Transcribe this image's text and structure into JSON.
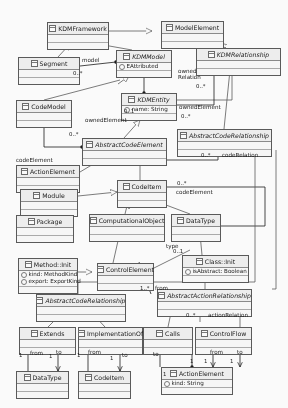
{
  "diagram": {
    "notation": "UML class diagram",
    "classes": [
      {
        "id": "kdmframework",
        "name": "KDMFramework",
        "abstract": false,
        "attributes": [],
        "x": 47,
        "y": 22,
        "w": 62,
        "h": 20
      },
      {
        "id": "modelelement",
        "name": "ModelElement",
        "abstract": false,
        "attributes": [],
        "x": 161,
        "y": 21,
        "w": 63,
        "h": 20
      },
      {
        "id": "segment",
        "name": "Segment",
        "abstract": false,
        "attributes": [],
        "x": 18,
        "y": 57,
        "w": 62,
        "h": 22
      },
      {
        "id": "kdmmodel",
        "name": "KDMModel",
        "abstract": true,
        "attributes": [
          "EAttributed"
        ],
        "x": 116,
        "y": 50,
        "w": 56,
        "h": 26
      },
      {
        "id": "kdmrelationship",
        "name": "KDMRelationship",
        "abstract": true,
        "attributes": [],
        "x": 196,
        "y": 48,
        "w": 85,
        "h": 20
      },
      {
        "id": "kdmentity",
        "name": "KDMEntity",
        "abstract": true,
        "attributes": [
          "name: String"
        ],
        "x": 121,
        "y": 93,
        "w": 56,
        "h": 25
      },
      {
        "id": "codemodel",
        "name": "CodeModel",
        "abstract": false,
        "attributes": [],
        "x": 16,
        "y": 100,
        "w": 56,
        "h": 22
      },
      {
        "id": "abstractcodeelement",
        "name": "AbstractCodeElement",
        "abstract": true,
        "attributes": [],
        "x": 82,
        "y": 138,
        "w": 85,
        "h": 19
      },
      {
        "id": "abstractcoderelationship1",
        "name": "AbstractCodeRelationship",
        "abstract": true,
        "attributes": [],
        "x": 177,
        "y": 129,
        "w": 95,
        "h": 19
      },
      {
        "id": "actionelement1",
        "name": "ActionElement",
        "abstract": false,
        "attributes": [],
        "x": 16,
        "y": 165,
        "w": 64,
        "h": 18
      },
      {
        "id": "module",
        "name": "Module",
        "abstract": false,
        "attributes": [],
        "x": 20,
        "y": 189,
        "w": 58,
        "h": 20
      },
      {
        "id": "package",
        "name": "Package",
        "abstract": false,
        "attributes": [],
        "x": 16,
        "y": 215,
        "w": 58,
        "h": 18
      },
      {
        "id": "codeitem1",
        "name": "CodeItem",
        "abstract": false,
        "attributes": [],
        "x": 117,
        "y": 180,
        "w": 50,
        "h": 20
      },
      {
        "id": "computationalobject",
        "name": "ComputationalObject",
        "abstract": false,
        "attributes": [],
        "x": 89,
        "y": 214,
        "w": 76,
        "h": 18
      },
      {
        "id": "datatype1",
        "name": "DataType",
        "abstract": false,
        "attributes": [],
        "x": 171,
        "y": 214,
        "w": 50,
        "h": 18
      },
      {
        "id": "methodinit",
        "name": "Method::Init",
        "abstract": false,
        "attributes": [
          "kind: MethodKind",
          "export: ExportKind"
        ],
        "x": 18,
        "y": 258,
        "w": 60,
        "h": 28
      },
      {
        "id": "controlelement",
        "name": "ControlElement",
        "abstract": false,
        "attributes": [],
        "x": 97,
        "y": 263,
        "w": 57,
        "h": 20
      },
      {
        "id": "classinit",
        "name": "Class::Init",
        "abstract": false,
        "attributes": [
          "isAbstract: Boolean"
        ],
        "x": 182,
        "y": 255,
        "w": 67,
        "h": 25
      },
      {
        "id": "abstractcoderelationship2",
        "name": "AbstractCodeRelationship",
        "abstract": true,
        "attributes": [],
        "x": 36,
        "y": 294,
        "w": 90,
        "h": 17
      },
      {
        "id": "abstractactionrelationship",
        "name": "AbstractActionRelationship",
        "abstract": true,
        "attributes": [],
        "x": 157,
        "y": 289,
        "w": 95,
        "h": 17
      },
      {
        "id": "extends",
        "name": "Extends",
        "abstract": false,
        "attributes": [],
        "x": 19,
        "y": 327,
        "w": 57,
        "h": 18
      },
      {
        "id": "implementationof",
        "name": "ImplementationOf",
        "abstract": false,
        "attributes": [],
        "x": 78,
        "y": 327,
        "w": 65,
        "h": 18
      },
      {
        "id": "calls",
        "name": "Calls",
        "abstract": false,
        "attributes": [],
        "x": 143,
        "y": 327,
        "w": 50,
        "h": 18
      },
      {
        "id": "controlflow",
        "name": "ControlFlow",
        "abstract": false,
        "attributes": [],
        "x": 195,
        "y": 327,
        "w": 57,
        "h": 18
      },
      {
        "id": "datatype2",
        "name": "DataType",
        "abstract": false,
        "attributes": [],
        "x": 16,
        "y": 371,
        "w": 53,
        "h": 18
      },
      {
        "id": "codeitem2",
        "name": "CodeItem",
        "abstract": false,
        "attributes": [],
        "x": 78,
        "y": 371,
        "w": 53,
        "h": 18
      },
      {
        "id": "actionelement2",
        "name": "ActionElement",
        "abstract": false,
        "attributes": [
          "kind: String"
        ],
        "x": 161,
        "y": 367,
        "w": 72,
        "h": 25
      }
    ],
    "association_labels": [
      {
        "id": "model",
        "text": "model",
        "x": 82,
        "y": 57
      },
      {
        "id": "ownedrelation",
        "text": "owned Relation",
        "x": 178,
        "y": 68,
        "wrap": true
      },
      {
        "id": "ownedelement-a",
        "text": "ownedElement",
        "x": 85,
        "y": 117
      },
      {
        "id": "ownedelement-b",
        "text": "ownedElement",
        "x": 179,
        "y": 104
      },
      {
        "id": "codeelement-left",
        "text": "codeElement",
        "x": 16,
        "y": 157
      },
      {
        "id": "coderelation",
        "text": "codeRelation",
        "x": 222,
        "y": 152
      },
      {
        "id": "codeelement-mid",
        "text": "codeElement",
        "x": 176,
        "y": 189
      },
      {
        "id": "type",
        "text": "type",
        "x": 166,
        "y": 243
      },
      {
        "id": "from-upper",
        "text": "from",
        "x": 155,
        "y": 285
      },
      {
        "id": "actionrelation",
        "text": "actionRelation",
        "x": 208,
        "y": 312
      },
      {
        "id": "from-extends",
        "text": "from",
        "x": 30,
        "y": 350
      },
      {
        "id": "to-extends",
        "text": "to",
        "x": 56,
        "y": 349
      },
      {
        "id": "from-implof",
        "text": "from",
        "x": 88,
        "y": 349
      },
      {
        "id": "to-implof",
        "text": "to",
        "x": 122,
        "y": 352
      },
      {
        "id": "to-calls",
        "text": "to",
        "x": 153,
        "y": 351
      },
      {
        "id": "from-cflow",
        "text": "from",
        "x": 210,
        "y": 349
      },
      {
        "id": "to-cflow",
        "text": "to",
        "x": 237,
        "y": 349
      }
    ],
    "multiplicities": [
      {
        "id": "m-segment-model",
        "text": "0..*",
        "x": 73,
        "y": 70
      },
      {
        "id": "m-kdmmodel-owned",
        "text": "0..1",
        "x": 124,
        "y": 108
      },
      {
        "id": "m-ownedrelation",
        "text": "0..*",
        "x": 196,
        "y": 83
      },
      {
        "id": "m-kdmentity-owned",
        "text": "0..*",
        "x": 181,
        "y": 113
      },
      {
        "id": "m-codemodel-elem",
        "text": "0..*",
        "x": 69,
        "y": 131
      },
      {
        "id": "m-coderelation",
        "text": "0..*",
        "x": 201,
        "y": 152
      },
      {
        "id": "m-codeitem-elem",
        "text": "0..*",
        "x": 177,
        "y": 180
      },
      {
        "id": "m-type",
        "text": "0..1",
        "x": 173,
        "y": 248
      },
      {
        "id": "m-from-upper",
        "text": "1..*",
        "x": 140,
        "y": 285
      },
      {
        "id": "m-actionrelation",
        "text": "0..*",
        "x": 186,
        "y": 312
      },
      {
        "id": "m-extends-1a",
        "text": "1",
        "x": 19,
        "y": 352
      },
      {
        "id": "m-extends-1b",
        "text": "1",
        "x": 49,
        "y": 353
      },
      {
        "id": "m-implof-1a",
        "text": "1",
        "x": 77,
        "y": 352
      },
      {
        "id": "m-implof-1b",
        "text": "1",
        "x": 110,
        "y": 355
      },
      {
        "id": "m-actionelement-1",
        "text": "1",
        "x": 163,
        "y": 371
      },
      {
        "id": "m-cflow-1a",
        "text": "1",
        "x": 204,
        "y": 358
      },
      {
        "id": "m-cflow-1b",
        "text": "1",
        "x": 230,
        "y": 358
      },
      {
        "id": "m-calls-1",
        "text": "1",
        "x": 190,
        "y": 358
      }
    ]
  }
}
